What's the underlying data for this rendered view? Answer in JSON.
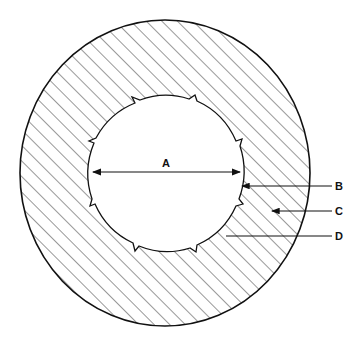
{
  "diagram": {
    "type": "cross-section",
    "shape": "hatched annular ring with notched inner bore",
    "colors": {
      "line": "#111111",
      "hatch": "#333333",
      "background": "#ffffff"
    },
    "labels": {
      "A": "A",
      "B": "B",
      "C": "C",
      "D": "D"
    },
    "annotations": [
      {
        "label": "A",
        "meaning": "double-headed dimension arrow across inner diameter"
      },
      {
        "label": "B",
        "meaning": "leader arrow pointing to inner bore edge"
      },
      {
        "label": "C",
        "meaning": "leader arrow pointing to hatched ring body"
      },
      {
        "label": "D",
        "meaning": "leader line to lower inner edge"
      }
    ],
    "inner_notches": 8
  }
}
